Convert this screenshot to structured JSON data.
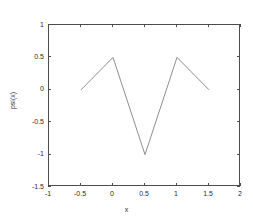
{
  "chart_data": {
    "type": "line",
    "title": "",
    "xlabel": "x",
    "ylabel": "psi(x)",
    "xlim": [
      -1,
      2
    ],
    "ylim": [
      -1.5,
      1
    ],
    "grid": false,
    "legend": null,
    "line_color": "#808080",
    "axis_color": "#4d4d4d",
    "background": "#ffffff",
    "xticks": [
      -1,
      -0.5,
      0,
      0.5,
      1,
      1.5,
      2
    ],
    "xtick_labels": [
      "-1",
      "-0.5",
      "0",
      "0.5",
      "1",
      "1.5",
      "2"
    ],
    "yticks": [
      1,
      0.5,
      0,
      -0.5,
      -1,
      -1.5
    ],
    "ytick_labels": [
      "1",
      "0.5",
      "0",
      "-0.5",
      "-1",
      "-1.5"
    ],
    "series": [
      {
        "name": "psi(x)",
        "x": [
          -0.5,
          0,
          0.5,
          1,
          1.5
        ],
        "y": [
          0,
          0.5,
          -1,
          0.5,
          0
        ]
      }
    ]
  }
}
